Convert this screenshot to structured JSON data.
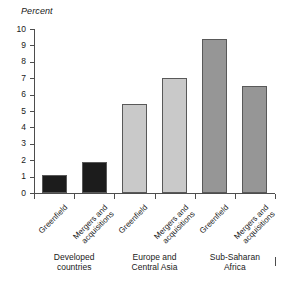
{
  "chart_data": {
    "type": "bar",
    "title": "",
    "subtitle": "",
    "ylabel": "Percent",
    "xlabel": "",
    "ylim": [
      0,
      10
    ],
    "ytick_step": 1,
    "grid": false,
    "legend": "none",
    "yticks": [
      "10",
      "9",
      "8",
      "7",
      "6",
      "5",
      "4",
      "3",
      "2",
      "1",
      "0"
    ],
    "categories": [
      "Greenfield",
      "Mergers and acquisitions",
      "Greenfield",
      "Mergers and acquisitions",
      "Greenfield",
      "Mergers and acquisitions"
    ],
    "category_lines": [
      [
        "Greenfield"
      ],
      [
        "Mergers and",
        "acquisitions"
      ],
      [
        "Greenfield"
      ],
      [
        "Mergers and",
        "acquisitions"
      ],
      [
        "Greenfield"
      ],
      [
        "Mergers and",
        "acquisitions"
      ]
    ],
    "values": [
      1.1,
      1.9,
      5.4,
      7.0,
      9.4,
      6.5
    ],
    "bar_colors": [
      "#1c1c1c",
      "#1c1c1c",
      "#c9c9c9",
      "#c9c9c9",
      "#969696",
      "#969696"
    ],
    "groups": [
      {
        "label_lines": [
          "Developed",
          "countries"
        ],
        "bars": [
          0,
          1
        ],
        "color": "#1c1c1c"
      },
      {
        "label_lines": [
          "Europe and",
          "Central Asia"
        ],
        "bars": [
          2,
          3
        ],
        "color": "#c9c9c9"
      },
      {
        "label_lines": [
          "Sub-Saharan",
          "Africa"
        ],
        "bars": [
          4,
          5
        ],
        "color": "#969696"
      }
    ],
    "axis_color": "#4d4d4d",
    "bar_edge_color": "#595959",
    "background": "#ffffff"
  }
}
